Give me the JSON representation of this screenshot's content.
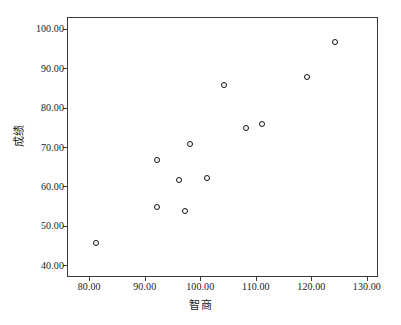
{
  "chart_data": {
    "type": "scatter",
    "title": "",
    "xlabel": "智商",
    "ylabel": "成绩",
    "xlim": [
      76,
      132
    ],
    "ylim": [
      37,
      103
    ],
    "xticks": [
      80,
      90,
      100,
      110,
      120,
      130
    ],
    "yticks": [
      40,
      50,
      60,
      70,
      80,
      90,
      100
    ],
    "xticklabels": [
      "80.00",
      "90.00",
      "100.00",
      "110.00",
      "120.00",
      "130.00"
    ],
    "yticklabels": [
      "40.00",
      "50.00",
      "60.00",
      "70.00",
      "80.00",
      "90.00",
      "100.00"
    ],
    "grid": false,
    "legend": false,
    "marker": "open-circle",
    "marker_color": "#101010",
    "points": [
      {
        "x": 81,
        "y": 46
      },
      {
        "x": 92,
        "y": 67
      },
      {
        "x": 92,
        "y": 55
      },
      {
        "x": 96,
        "y": 62
      },
      {
        "x": 97,
        "y": 54
      },
      {
        "x": 98,
        "y": 71
      },
      {
        "x": 101,
        "y": 62.5
      },
      {
        "x": 104,
        "y": 86
      },
      {
        "x": 108,
        "y": 75
      },
      {
        "x": 111,
        "y": 76
      },
      {
        "x": 119,
        "y": 88
      },
      {
        "x": 124,
        "y": 97
      }
    ]
  }
}
